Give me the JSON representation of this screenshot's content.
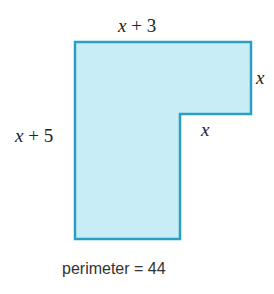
{
  "figure": {
    "shape": "L-shaped polygon",
    "fill_color": "#c9edf7",
    "stroke_color": "#2a9fc4",
    "vertices": [
      [
        75,
        42
      ],
      [
        251,
        42
      ],
      [
        251,
        114
      ],
      [
        180,
        114
      ],
      [
        180,
        239
      ],
      [
        75,
        239
      ]
    ],
    "labels": {
      "top": {
        "var": "x",
        "rest": " + 3"
      },
      "right_upper": {
        "var": "x"
      },
      "notch": {
        "var": "x"
      },
      "left": {
        "var": "x",
        "rest": " + 5"
      }
    },
    "caption": "perimeter = 44"
  }
}
